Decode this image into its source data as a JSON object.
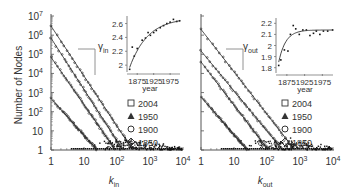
{
  "chart_data": [
    {
      "type": "scatter",
      "panel": "left",
      "title": "",
      "xlabel": "k_in",
      "ylabel": "Number of Nodes",
      "xscale": "log",
      "yscale": "log",
      "xlim": [
        1,
        10000
      ],
      "ylim": [
        1,
        10000000
      ],
      "x_ticks": [
        "1",
        "10",
        "10^2",
        "10^3",
        "10^4"
      ],
      "y_ticks": [
        "1",
        "10",
        "10^2",
        "10^3",
        "10^4",
        "10^5",
        "10^6",
        "10^7"
      ],
      "legend": [
        "2004",
        "1950",
        "1900",
        "1850"
      ],
      "legend_markers": [
        "square",
        "triangle",
        "circle",
        "diamond"
      ],
      "legend_position": "right-middle",
      "series": [
        {
          "name": "2004",
          "marker": "square",
          "fit_start_y": 3000000,
          "fit_end_x": 300,
          "points": [
            [
              1,
              3000000
            ],
            [
              2,
              2800000
            ],
            [
              3,
              300000
            ],
            [
              5,
              100000
            ],
            [
              10,
              12000
            ],
            [
              30,
              500
            ],
            [
              100,
              30
            ],
            [
              300,
              3
            ]
          ]
        },
        {
          "name": "1950",
          "marker": "triangle",
          "fit_start_y": 700000,
          "fit_end_x": 150,
          "points": [
            [
              1,
              700000
            ],
            [
              2,
              150000
            ],
            [
              5,
              12000
            ],
            [
              10,
              2500
            ],
            [
              30,
              200
            ],
            [
              100,
              12
            ],
            [
              150,
              2
            ]
          ]
        },
        {
          "name": "1900",
          "marker": "circle",
          "fit_start_y": 70000,
          "fit_end_x": 90,
          "points": [
            [
              1,
              70000
            ],
            [
              2,
              15000
            ],
            [
              5,
              1500
            ],
            [
              10,
              300
            ],
            [
              30,
              30
            ],
            [
              90,
              2
            ]
          ]
        },
        {
          "name": "1850",
          "marker": "diamond",
          "fit_start_y": 500,
          "fit_end_x": 25,
          "points": [
            [
              1,
              500
            ],
            [
              2,
              150
            ],
            [
              5,
              40
            ],
            [
              10,
              10
            ],
            [
              25,
              1
            ]
          ]
        }
      ],
      "inset": {
        "type": "scatter",
        "ylabel": "γ_in",
        "xlabel": "year",
        "x_ticks": [
          "1875",
          "1925",
          "1975"
        ],
        "y_ticks": [
          "2",
          "2.2",
          "2.4",
          "2.6"
        ],
        "ylim": [
          1.93,
          2.68
        ],
        "xlim": [
          1850,
          2005
        ],
        "points": [
          [
            1852,
            1.94
          ],
          [
            1860,
            2.26
          ],
          [
            1866,
            2.13
          ],
          [
            1875,
            2.24
          ],
          [
            1890,
            2.36
          ],
          [
            1900,
            2.39
          ],
          [
            1908,
            2.47
          ],
          [
            1915,
            2.43
          ],
          [
            1925,
            2.47
          ],
          [
            1933,
            2.5
          ],
          [
            1945,
            2.54
          ],
          [
            1955,
            2.57
          ],
          [
            1965,
            2.6
          ],
          [
            1975,
            2.62
          ],
          [
            1985,
            2.66
          ],
          [
            1995,
            2.63
          ],
          [
            2004,
            2.64
          ]
        ],
        "fit": "saturating curve from 2.0 to ~2.65"
      }
    },
    {
      "type": "scatter",
      "panel": "right",
      "title": "",
      "xlabel": "k_out",
      "ylabel": "",
      "xscale": "log",
      "yscale": "log",
      "xlim": [
        1,
        10000
      ],
      "ylim": [
        1,
        10000000
      ],
      "x_ticks": [
        "1",
        "10",
        "10^2",
        "10^3",
        "10^4"
      ],
      "legend": [
        "2004",
        "1950",
        "1900",
        "1850"
      ],
      "legend_markers": [
        "square",
        "triangle",
        "circle",
        "diamond"
      ],
      "legend_position": "right-middle",
      "series": [
        {
          "name": "2004",
          "marker": "square",
          "fit_start_y": 2000000,
          "fit_end_x": 700,
          "points": [
            [
              1,
              2000000
            ],
            [
              3,
              500000
            ],
            [
              10,
              60000
            ],
            [
              30,
              6000
            ],
            [
              100,
              400
            ],
            [
              300,
              20
            ],
            [
              700,
              2
            ]
          ]
        },
        {
          "name": "1950",
          "marker": "triangle",
          "fit_start_y": 150000,
          "fit_end_x": 300,
          "points": [
            [
              1,
              150000
            ],
            [
              3,
              30000
            ],
            [
              10,
              5000
            ],
            [
              30,
              600
            ],
            [
              100,
              50
            ],
            [
              300,
              2
            ]
          ]
        },
        {
          "name": "1900",
          "marker": "circle",
          "fit_start_y": 40000,
          "fit_end_x": 110,
          "points": [
            [
              1,
              40000
            ],
            [
              3,
              8000
            ],
            [
              10,
              1000
            ],
            [
              30,
              80
            ],
            [
              110,
              2
            ]
          ]
        },
        {
          "name": "1850",
          "marker": "diamond",
          "fit_start_y": 600,
          "fit_end_x": 25,
          "points": [
            [
              1,
              600
            ],
            [
              3,
              150
            ],
            [
              7,
              40
            ],
            [
              15,
              10
            ],
            [
              25,
              1
            ]
          ]
        }
      ],
      "inset": {
        "type": "scatter",
        "ylabel": "γ_out",
        "xlabel": "year",
        "x_ticks": [
          "1875",
          "1925",
          "1975"
        ],
        "y_ticks": [
          "1.8",
          "1.9",
          "2",
          "2.1",
          "2.2"
        ],
        "ylim": [
          1.77,
          2.23
        ],
        "xlim": [
          1850,
          2005
        ],
        "points": [
          [
            1852,
            1.82
          ],
          [
            1858,
            1.87
          ],
          [
            1868,
            1.96
          ],
          [
            1878,
            1.95
          ],
          [
            1885,
            2.1
          ],
          [
            1893,
            2.18
          ],
          [
            1900,
            2.15
          ],
          [
            1910,
            2.1
          ],
          [
            1920,
            2.14
          ],
          [
            1930,
            2.14
          ],
          [
            1940,
            2.09
          ],
          [
            1950,
            2.11
          ],
          [
            1958,
            2.13
          ],
          [
            1968,
            2.1
          ],
          [
            1978,
            2.13
          ],
          [
            1990,
            2.13
          ],
          [
            2004,
            2.14
          ]
        ],
        "fit": "saturating curve from 1.8 to ~2.13"
      }
    }
  ],
  "labels": {
    "ylabel": "Number of Nodes",
    "left_xlabel_main": "k",
    "left_xlabel_sub": "in",
    "right_xlabel_main": "k",
    "right_xlabel_sub": "out",
    "left_gamma_main": "γ",
    "left_gamma_sub": "in",
    "right_gamma_main": "γ",
    "right_gamma_sub": "out",
    "inset_xlabel": "year",
    "x_ticks": [
      "1",
      "10",
      "10",
      "10",
      "10"
    ],
    "x_tick_exps": [
      "",
      "",
      "2",
      "3",
      "4"
    ],
    "y_ticks_base": [
      "1",
      "10",
      "10",
      "10",
      "10",
      "10",
      "10",
      "10"
    ],
    "y_tick_exps": [
      "",
      "",
      "2",
      "3",
      "4",
      "5",
      "6",
      "7"
    ],
    "inset_year_ticks": [
      "1875",
      "1925",
      "1975"
    ],
    "left_inset_y_ticks": [
      "2",
      "2.2",
      "2.4",
      "2.6"
    ],
    "right_inset_y_ticks": [
      "1.8",
      "1.9",
      "2",
      "2.1",
      "2.2"
    ],
    "legend": [
      "2004",
      "1950",
      "1900",
      "1850"
    ]
  }
}
